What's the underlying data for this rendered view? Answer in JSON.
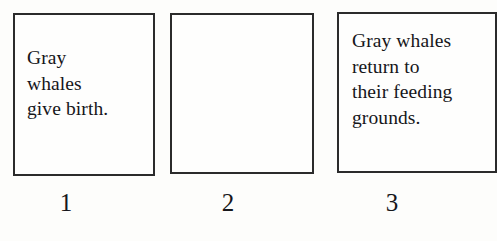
{
  "diagram": {
    "type": "sequence-boxes",
    "background_color": "#fdfdfb",
    "border_color": "#2b2b2b",
    "text_color": "#16161a",
    "boxes": [
      {
        "number": "1",
        "text": "Gray\nwhales\ngive birth.",
        "empty": false
      },
      {
        "number": "2",
        "text": "",
        "empty": true
      },
      {
        "number": "3",
        "text": "Gray whales\nreturn to\ntheir feeding\ngrounds.",
        "empty": false
      }
    ]
  }
}
